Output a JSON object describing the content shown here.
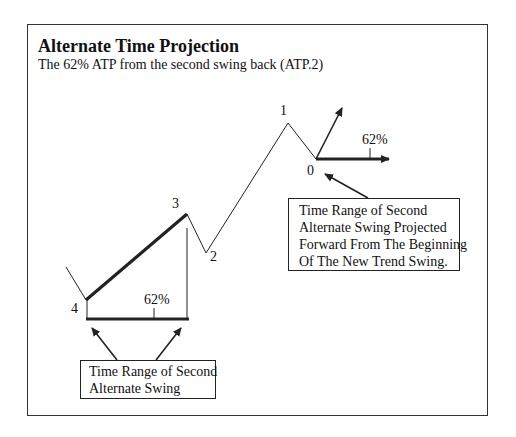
{
  "header": {
    "title": "Alternate Time Projection",
    "subtitle": "The 62% ATP from the second swing back (ATP.2)"
  },
  "diagram": {
    "swing_points": [
      {
        "label": "4",
        "x": 86,
        "y": 300
      },
      {
        "label": "3",
        "x": 187,
        "y": 214
      },
      {
        "label": "2",
        "x": 206,
        "y": 253
      },
      {
        "label": "1",
        "x": 288,
        "y": 123
      },
      {
        "label": "0",
        "x": 316,
        "y": 159
      }
    ],
    "labels": {
      "p4": "4",
      "p3": "3",
      "p2": "2",
      "p1": "1",
      "p0": "0",
      "pct_left": "62%",
      "pct_right": "62%"
    },
    "callouts": {
      "right": {
        "lines": [
          "Time Range of Second",
          "Alternate Swing Projected",
          "Forward From The Beginning",
          "Of The New Trend Swing."
        ]
      },
      "left": {
        "lines": [
          "Time Range of Second",
          "Alternate Swing"
        ]
      }
    },
    "colors": {
      "line": "#222222",
      "frame": "#333333",
      "background": "#ffffff"
    }
  }
}
